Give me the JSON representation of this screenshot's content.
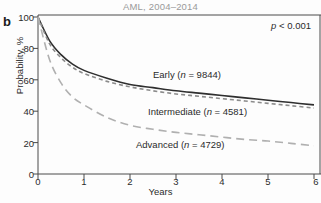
{
  "figure": {
    "panel_label": "b",
    "title": "AML, 2004–2014",
    "pvalue": "p < 0.001",
    "pvalue_italic": "p",
    "pvalue_rest": " < 0.001"
  },
  "axes": {
    "xlabel": "Years",
    "ylabel": "Probability, %",
    "xticks": [
      "0",
      "1",
      "2",
      "3",
      "4",
      "5",
      "6"
    ],
    "yticks": [
      "0",
      "20",
      "40",
      "60",
      "80",
      "100"
    ]
  },
  "legend": {
    "early": {
      "name": "Early",
      "n_prefix": "(",
      "n_italic": "n",
      "n_value": " = 9844)"
    },
    "intermediate": {
      "name": "Intermediate",
      "n_prefix": "(",
      "n_italic": "n",
      "n_value": " = 4581)"
    },
    "advanced": {
      "name": "Advanced",
      "n_prefix": "(",
      "n_italic": "n",
      "n_value": " = 4729)"
    }
  },
  "colors": {
    "early": "#2f2f2f",
    "intermediate": "#8c8c8c",
    "advanced": "#b0b0b0",
    "axis": "#4a4a4a",
    "title": "#9a9a9a"
  },
  "chart_data": {
    "type": "line",
    "title": "AML, 2004–2014",
    "xlabel": "Years",
    "ylabel": "Probability, %",
    "xlim": [
      0,
      6
    ],
    "ylim": [
      0,
      100
    ],
    "xticks": [
      0,
      1,
      2,
      3,
      4,
      5,
      6
    ],
    "yticks": [
      0,
      20,
      40,
      60,
      80,
      100
    ],
    "grid": false,
    "legend_position": "inline-annotations",
    "annotations": [
      "p < 0.001"
    ],
    "x": [
      0,
      0.25,
      0.5,
      0.75,
      1,
      1.5,
      2,
      2.5,
      3,
      3.5,
      4,
      4.5,
      5,
      5.5,
      6
    ],
    "series": [
      {
        "name": "Early",
        "n": 9844,
        "style": "solid",
        "color": "#2f2f2f",
        "values": [
          100,
          85,
          76,
          70,
          66,
          61,
          57,
          55,
          53,
          51.5,
          50,
          48.5,
          47,
          45.5,
          44
        ]
      },
      {
        "name": "Intermediate",
        "n": 4581,
        "style": "dashed-short",
        "color": "#8c8c8c",
        "values": [
          100,
          83,
          74,
          68,
          64,
          59,
          55.5,
          53,
          51,
          49.5,
          48,
          46.5,
          45,
          43.5,
          42
        ]
      },
      {
        "name": "Advanced",
        "n": 4729,
        "style": "dashed-long",
        "color": "#b0b0b0",
        "values": [
          100,
          73,
          58,
          49,
          44,
          36,
          31,
          28.5,
          26.5,
          25,
          23.5,
          22,
          21,
          19.5,
          18
        ]
      }
    ]
  }
}
